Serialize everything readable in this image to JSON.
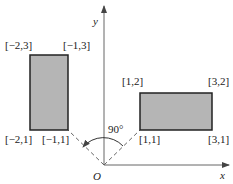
{
  "diagram": {
    "title": "",
    "axes": {
      "x_label": "x",
      "y_label": "y",
      "origin_label": "O"
    },
    "rotation": {
      "angle_label": "90°",
      "direction": "counterclockwise"
    },
    "rectangles": [
      {
        "name": "rotated-rectangle",
        "corners": {
          "top_left": "[−2,3]",
          "top_right": "[−1,3]",
          "bottom_left": "[−2,1]",
          "bottom_right": "[−1,1]"
        }
      },
      {
        "name": "original-rectangle",
        "corners": {
          "top_left": "[1,2]",
          "top_right": "[3,2]",
          "bottom_left": "[1,1]",
          "bottom_right": "[3,1]"
        }
      }
    ],
    "colors": {
      "fill": "#b5b5b5",
      "stroke": "#222222",
      "axis": "#555555",
      "dash": "#555555"
    }
  }
}
